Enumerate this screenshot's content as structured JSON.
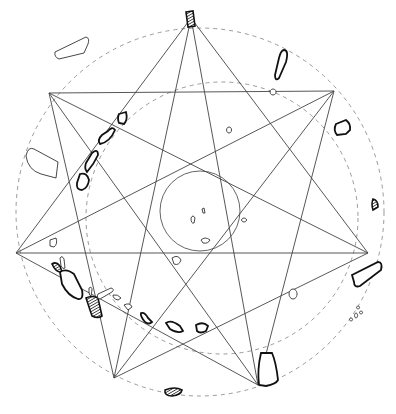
{
  "diagram": {
    "colors": {
      "line": "#444444",
      "dashed_circle": "#9a9a9a",
      "stone_outline": "#111111",
      "background": "#ffffff"
    },
    "circles": [
      {
        "name": "outer-dashed-circle",
        "cx": 200,
        "cy": 212,
        "r": 184,
        "style": "dashed"
      },
      {
        "name": "inner-dashed-circle",
        "cx": 222,
        "cy": 218,
        "r": 136,
        "style": "dashed"
      },
      {
        "name": "central-circle",
        "cx": 200,
        "cy": 211,
        "r": 40,
        "style": "solid"
      }
    ],
    "vertices": [
      {
        "id": "V0",
        "x": 191,
        "y": 18
      },
      {
        "id": "V1",
        "x": 334,
        "y": 91
      },
      {
        "id": "V2",
        "x": 368,
        "y": 253
      },
      {
        "id": "V3",
        "x": 258,
        "y": 385
      },
      {
        "id": "V4",
        "x": 114,
        "y": 378
      },
      {
        "id": "V5",
        "x": 16,
        "y": 253
      },
      {
        "id": "V6",
        "x": 49,
        "y": 93
      }
    ],
    "star_7_2_edges": [
      [
        6,
        1
      ],
      [
        0,
        2
      ],
      [
        0,
        5
      ],
      [
        6,
        4
      ],
      [
        1,
        3
      ],
      [
        5,
        3
      ],
      [
        4,
        2
      ]
    ],
    "star_7_3_edges": [
      [
        0,
        3
      ],
      [
        0,
        4
      ],
      [
        1,
        4
      ],
      [
        1,
        5
      ],
      [
        2,
        5
      ],
      [
        2,
        6
      ],
      [
        3,
        6
      ]
    ],
    "stones": [
      {
        "name": "stone-top",
        "kind": "hatched",
        "d": "M186 12 L193 11 L195 26 L188 27 Z"
      },
      {
        "name": "stone-nw-outlier",
        "kind": "thin",
        "d": "M55 52 L86 37 Q90 38 88 44 L84 53 L59 59 Q54 57 55 52 Z"
      },
      {
        "name": "stone-ne-tall",
        "kind": "bold",
        "d": "M284 50 Q289 50 286 62 L279 78 Q275 82 275 75 L279 58 Q281 50 284 50 Z"
      },
      {
        "name": "stone-ne-small-ring",
        "kind": "thin",
        "d": "M273 89 a3 3 0 1 0 0.1 0 Z"
      },
      {
        "name": "stone-east",
        "kind": "bold",
        "d": "M336 124 L346 120 Q351 124 350 130 L346 134 L337 135 Q333 130 336 124 Z"
      },
      {
        "name": "stone-east-2",
        "kind": "hatched",
        "d": "M373 199 Q378 200 378 207 L373 210 Q371 204 373 199 Z"
      },
      {
        "name": "stone-se-long",
        "kind": "bold",
        "d": "M352 275 L378 262 Q383 262 381 270 L360 286 Q354 288 354 282 Z"
      },
      {
        "name": "stone-se-large",
        "kind": "bold",
        "d": "M261 353 L272 353 Q276 362 278 380 Q276 384 266 386 L259 385 Q257 370 261 353 Z"
      },
      {
        "name": "stone-south",
        "kind": "hatched",
        "d": "M165 390 Q175 386 182 390 Q181 395 172 396 Q164 396 165 390 Z"
      },
      {
        "name": "stone-west-outlier",
        "kind": "thin",
        "d": "M26 156 Q28 146 34 149 L58 162 L56 178 L41 174 Q28 170 26 156 Z"
      },
      {
        "name": "stone-arc-1",
        "kind": "bold",
        "d": "M119 114 L126 112 Q128 120 124 124 L119 123 Q117 118 119 114 Z"
      },
      {
        "name": "stone-arc-2",
        "kind": "bold",
        "d": "M108 131 Q112 126 115 130 Q110 142 100 144 Q97 140 102 135 Z"
      },
      {
        "name": "stone-arc-3",
        "kind": "bold",
        "d": "M92 153 Q98 148 98 155 Q94 164 87 172 Q84 168 86 163 Z"
      },
      {
        "name": "stone-arc-4",
        "kind": "bold",
        "d": "M80 174 Q87 172 89 180 Q88 188 82 190 Q76 190 77 183 Z"
      },
      {
        "name": "stone-w-small",
        "kind": "thin",
        "d": "M50 240 L56 238 Q58 244 54 247 L50 246 Z"
      },
      {
        "name": "stone-sw-hatched-small",
        "kind": "hatched",
        "d": "M52 264 Q56 261 60 266 L62 272 Q56 273 52 264 Z"
      },
      {
        "name": "stone-sw-pill",
        "kind": "thin",
        "d": "M60 258 Q62 255 64 259 L65 268 Q63 270 61 266 Z"
      },
      {
        "name": "stone-sw-large",
        "kind": "bold",
        "d": "M60 272 Q66 268 74 274 L82 290 Q84 300 78 299 Q68 296 62 284 Z"
      },
      {
        "name": "stone-sw-hatched-large",
        "kind": "hatched",
        "d": "M86 298 Q92 295 98 298 L102 316 Q98 319 92 316 Z"
      },
      {
        "name": "stone-arc-5",
        "kind": "thin",
        "d": "M89 288 Q92 286 92 290 L91 296 Q89 296 89 292 Z"
      },
      {
        "name": "stone-arc-6",
        "kind": "thin",
        "d": "M98 294 L111 288 Q115 289 112 292 L100 299 Q96 298 98 294 Z"
      },
      {
        "name": "stone-arc-7",
        "kind": "thin",
        "d": "M113 295 Q118 294 121 298 L118 300 Q113 299 113 295 Z"
      },
      {
        "name": "stone-arc-8",
        "kind": "thin",
        "d": "M124 305 Q130 302 132 307 L128 310 Z"
      },
      {
        "name": "stone-arc-9",
        "kind": "bold",
        "d": "M141 313 Q145 312 148 318 L152 322 Q149 325 145 322 Q140 316 141 313 Z"
      },
      {
        "name": "stone-arc-10",
        "kind": "bold",
        "d": "M166 323 Q171 319 180 326 L183 331 Q178 334 170 329 Z"
      },
      {
        "name": "stone-arc-11",
        "kind": "bold",
        "d": "M196 325 Q203 321 208 326 L206 331 Q200 334 197 331 Z"
      },
      {
        "name": "stone-se-ring",
        "kind": "thin",
        "d": "M293 289 a4 5 0 1 0 0.1 0 Z"
      },
      {
        "name": "stone-center-1",
        "kind": "thin",
        "d": "M191 218 Q193 214 195 218 L194 223 Q191 224 191 218 Z"
      },
      {
        "name": "stone-center-2",
        "kind": "thin",
        "d": "M202 209 L204 208 L205 213 L203 213 Z"
      },
      {
        "name": "stone-center-3",
        "kind": "thin",
        "d": "M201 240 Q205 236 210 240 Q208 244 203 243 Z"
      },
      {
        "name": "stone-center-4",
        "kind": "thin",
        "d": "M172 258 Q178 254 181 260 Q179 266 174 264 Z"
      },
      {
        "name": "stone-center-5",
        "kind": "thin",
        "d": "M229 127 a2.5 3 0 1 0 0.1 0 Z"
      },
      {
        "name": "stone-center-6",
        "kind": "thin",
        "d": "M244 218 a2.5 2 0 1 0 0.1 0 Z"
      },
      {
        "name": "stone-se-cluster-1",
        "kind": "thin",
        "d": "M351 318 a1.5 1.5 0 1 0 0.1 0 Z"
      },
      {
        "name": "stone-se-cluster-2",
        "kind": "thin",
        "d": "M356 313 a1.5 2.5 0 1 0 0.1 0 Z"
      },
      {
        "name": "stone-se-cluster-3",
        "kind": "thin",
        "d": "M361 311 a1.5 1.5 0 1 0 0.1 0 Z"
      },
      {
        "name": "stone-se-cluster-4",
        "kind": "thin",
        "d": "M358 306 a1.5 1.5 0 1 0 0.1 0 Z"
      }
    ]
  }
}
